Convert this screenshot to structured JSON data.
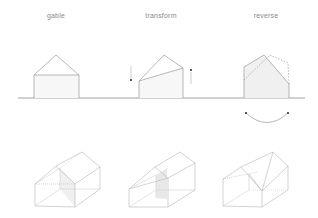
{
  "diagram": {
    "panels": [
      {
        "id": "gable",
        "label": "gable"
      },
      {
        "id": "transform",
        "label": "transform"
      },
      {
        "id": "reverse",
        "label": "reverse"
      }
    ],
    "colors": {
      "stroke": "#9a9a9a",
      "ground": "#8c8c8c",
      "fill": "#f2f2f2",
      "shade": "#e6e6e6",
      "arrow": "#555555"
    }
  }
}
